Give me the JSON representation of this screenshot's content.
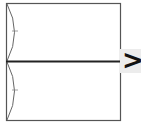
{
  "diagram": {
    "type": "folding-step",
    "shapes": {
      "outer_rect": {
        "x": 6,
        "y": 3,
        "w": 114,
        "h": 117,
        "stroke": "#555555"
      },
      "center_line": {
        "y": 61,
        "stroke": "#222222",
        "width": 2
      },
      "arcs": [
        {
          "name": "upper-arc",
          "from_y": 3,
          "to_y": 61,
          "bulge_x": 15,
          "tick_y": 31
        },
        {
          "name": "lower-arc",
          "from_y": 61,
          "to_y": 120,
          "bulge_x": 15,
          "tick_y": 90
        }
      ]
    },
    "next_step_arrow": ">",
    "colors": {
      "stroke": "#555555",
      "arrow_bg": "#ececec",
      "arrow": "#111111"
    }
  }
}
